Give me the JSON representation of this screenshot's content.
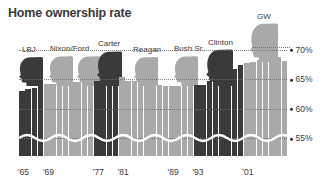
{
  "chart_data": {
    "type": "bar",
    "title": "Home ownership rate",
    "xlabel": "",
    "ylabel": "",
    "ylim": [
      52,
      71
    ],
    "grid": true,
    "axis_break": true,
    "legend_position": "none",
    "y_ticks": [
      "70%",
      "65%",
      "60%",
      "55%"
    ],
    "y_tick_values": [
      70,
      65,
      60,
      55
    ],
    "x_ticks": [
      "'65",
      "'69",
      "'77",
      "'81",
      "'89",
      "'93",
      "'01"
    ],
    "x_tick_years": [
      1965,
      1969,
      1977,
      1981,
      1989,
      1993,
      2001
    ],
    "categories": [
      1965,
      1966,
      1967,
      1968,
      1969,
      1970,
      1971,
      1972,
      1973,
      1974,
      1975,
      1976,
      1977,
      1978,
      1979,
      1980,
      1981,
      1982,
      1983,
      1984,
      1985,
      1986,
      1987,
      1988,
      1989,
      1990,
      1991,
      1992,
      1993,
      1994,
      1995,
      1996,
      1997,
      1998,
      1999,
      2000,
      2001,
      2002,
      2003,
      2004,
      2005,
      2006,
      2007
    ],
    "values": [
      63.0,
      63.4,
      63.6,
      63.9,
      64.3,
      64.2,
      64.2,
      64.4,
      64.5,
      64.6,
      64.6,
      64.7,
      64.8,
      65.0,
      65.6,
      65.6,
      65.4,
      64.8,
      64.7,
      64.5,
      63.9,
      63.8,
      64.0,
      63.8,
      63.9,
      63.9,
      64.1,
      64.1,
      64.0,
      64.0,
      64.7,
      65.4,
      65.7,
      66.3,
      66.8,
      67.4,
      67.8,
      67.9,
      68.3,
      69.0,
      68.9,
      68.8,
      68.1
    ],
    "annotations": [
      {
        "label": "70%",
        "type": "leader-line",
        "target_year": 2004
      }
    ]
  },
  "presidents": [
    {
      "name": "LBJ",
      "label_x": 22,
      "tone": "dark",
      "heads": 1,
      "start_year": 1965,
      "end_year": 1968
    },
    {
      "name": "Nixon/Ford",
      "label_x": 50,
      "tone": "light",
      "heads": 2,
      "start_year": 1969,
      "end_year": 1976
    },
    {
      "name": "Carter",
      "label_x": 98,
      "tone": "dark",
      "heads": 1,
      "start_year": 1977,
      "end_year": 1980
    },
    {
      "name": "Reagan",
      "label_x": 133,
      "tone": "light",
      "heads": 1,
      "start_year": 1981,
      "end_year": 1988
    },
    {
      "name": "Bush Sr.",
      "label_x": 174,
      "tone": "light",
      "heads": 1,
      "start_year": 1989,
      "end_year": 1992
    },
    {
      "name": "Clinton",
      "label_x": 208,
      "tone": "dark",
      "heads": 1,
      "start_year": 1993,
      "end_year": 2000
    },
    {
      "name": "GW",
      "label_x": 257,
      "tone": "light",
      "heads": 1,
      "start_year": 2001,
      "end_year": 2007
    }
  ],
  "colors": {
    "bar_dark": "#3a3a3a",
    "bar_light": "#a9a9a9",
    "text": "#3b3b3b",
    "gridline": "#6f6f6f",
    "background": "#ffffff"
  }
}
